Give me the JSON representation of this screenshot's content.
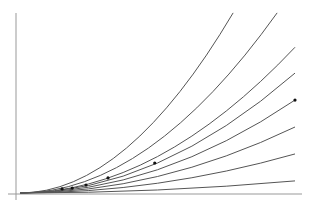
{
  "chart_data": {
    "type": "line",
    "title": "",
    "xlabel": "",
    "ylabel": "",
    "grid": false,
    "legend": null,
    "xlim": [
      0,
      1.04
    ],
    "ylim": [
      -0.02,
      0.66
    ],
    "series": [
      {
        "name": "curve-1",
        "x": [
          0,
          0.25,
          0.5,
          0.775
        ],
        "y": [
          0,
          0.06,
          0.25,
          0.655
        ]
      },
      {
        "name": "curve-2",
        "x": [
          0,
          0.25,
          0.5,
          0.935
        ],
        "y": [
          0,
          0.05,
          0.2,
          0.655
        ]
      },
      {
        "name": "curve-3",
        "x": [
          0,
          0.25,
          0.5,
          1.0
        ],
        "y": [
          0,
          0.05,
          0.16,
          0.53
        ]
      },
      {
        "name": "curve-4",
        "x": [
          0,
          0.25,
          0.5,
          1.0
        ],
        "y": [
          0,
          0.045,
          0.14,
          0.436
        ]
      },
      {
        "name": "curve-5",
        "x": [
          0,
          0.25,
          0.5,
          1.0
        ],
        "y": [
          0,
          0.04,
          0.11,
          0.338
        ]
      },
      {
        "name": "curve-6",
        "x": [
          0,
          0.25,
          0.5,
          1.0
        ],
        "y": [
          0,
          0.03,
          0.085,
          0.24
        ]
      },
      {
        "name": "curve-7",
        "x": [
          0,
          0.25,
          0.5,
          1.0
        ],
        "y": [
          0,
          0.025,
          0.06,
          0.142
        ]
      },
      {
        "name": "curve-8",
        "x": [
          0,
          0.25,
          0.5,
          1.0
        ],
        "y": [
          0,
          0.01,
          0.02,
          0.044
        ]
      }
    ],
    "points": [
      {
        "x": 1.0,
        "y": 0.338
      },
      {
        "x": 0.49,
        "y": 0.109
      },
      {
        "x": 0.32,
        "y": 0.055
      },
      {
        "x": 0.24,
        "y": 0.029
      },
      {
        "x": 0.19,
        "y": 0.018
      },
      {
        "x": 0.153,
        "y": 0.015
      }
    ]
  },
  "style": {
    "curve_color": "#555555",
    "axis_color": "#999999",
    "dot_color": "#111111",
    "background": "#ffffff"
  }
}
